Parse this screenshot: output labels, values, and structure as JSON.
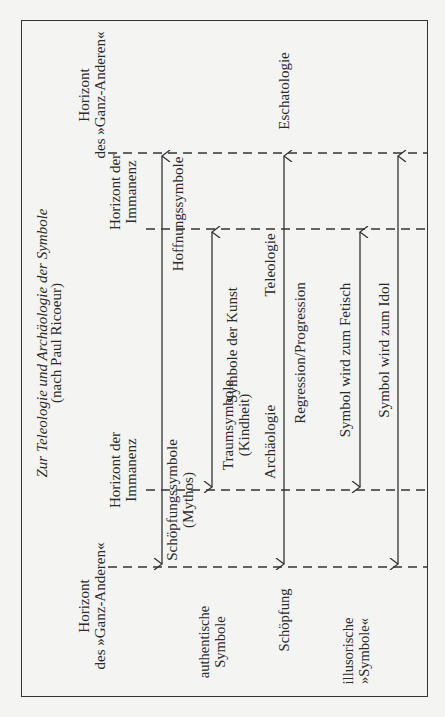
{
  "title": {
    "main": "Zur Teleologie und Archäologie der Symbole",
    "sub": "(nach Paul Ricoeur)"
  },
  "horizons": {
    "top_ganz_anderen": [
      "Horizont",
      "des »Ganz-Anderen«"
    ],
    "top_immanenz": [
      "Horizont der",
      "Immanenz"
    ],
    "bottom_immanenz": [
      "Horizont der",
      "Immanenz"
    ],
    "bottom_ganz_anderen": [
      "Horizont",
      "des »Ganz-Anderen«"
    ]
  },
  "symbols": {
    "hoffnung": "Hoffnungssymbole",
    "schoepfung": [
      "Schöpfungssymbole",
      "(Mythos)"
    ],
    "kunst": "Symbole der Kunst",
    "traum": [
      "Traumsymbole",
      "(Kindheit)"
    ]
  },
  "axis": {
    "teleologie": "Teleologie",
    "archaeologie": "Archäologie",
    "regression_progression": "Regression/Progression",
    "eschatologie": "Eschatologie",
    "schoepfung": "Schöpfung"
  },
  "categories": {
    "authentic": [
      "authentische",
      "Symbole"
    ],
    "illusory": [
      "illusorische",
      "»Symbole«"
    ]
  },
  "illusory_arrows": {
    "fetisch": "Symbol wird zum Fetisch",
    "idol": "Symbol wird zum Idol"
  },
  "colors": {
    "line": "#333333",
    "background": "#f4f4f2",
    "text": "#2a2a2a"
  }
}
